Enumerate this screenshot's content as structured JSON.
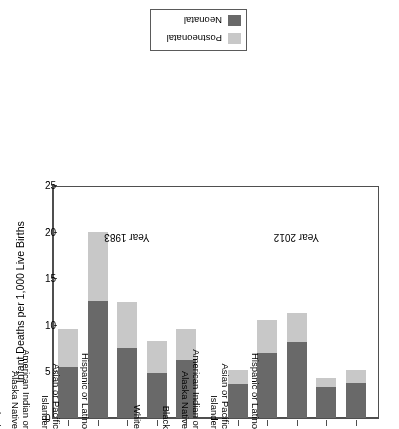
{
  "chart_data": {
    "type": "bar",
    "title": "",
    "subtitle": "",
    "orientation": "vertical-stacked",
    "rotated_180": true,
    "xlabel": "",
    "ylabel": "Infant Deaths per 1,000 Live Births",
    "ylim": [
      0,
      25
    ],
    "yticks": [
      0,
      5,
      10,
      15,
      20,
      25
    ],
    "ytick_labels": [
      "0",
      "5",
      "10",
      "15",
      "20",
      "25"
    ],
    "grid": false,
    "legend_position": "top-center",
    "legend": [
      {
        "name": "Postneonatal",
        "color": "#c8c8c8"
      },
      {
        "name": "Neonatal",
        "color": "#696969"
      }
    ],
    "series": [
      {
        "name": "Neonatal",
        "color": "#696969"
      },
      {
        "name": "Postneonatal",
        "color": "#c8c8c8"
      }
    ],
    "groups": [
      {
        "label": "Year 2012",
        "categories": [
          "Hispanic or Latino",
          "Asian or Pacific\nIslander",
          "American Indian or\nAlaska Native",
          "Black",
          "White"
        ],
        "values": {
          "Neonatal": [
            3.8,
            3.3,
            8.2,
            7.0,
            3.7
          ],
          "Postneonatal": [
            1.4,
            1.0,
            3.1,
            3.5,
            1.4
          ]
        },
        "totals": [
          5.2,
          4.3,
          11.3,
          10.5,
          5.1
        ]
      },
      {
        "label": "Year 1983",
        "categories": [
          "Hispanic or Latino",
          "Asian or Pacific\nIslander",
          "American Indian or\nAlaska Native",
          "Black",
          "White"
        ],
        "values": {
          "Neonatal": [
            6.2,
            4.8,
            7.5,
            12.5,
            5.5
          ],
          "Postneonatal": [
            3.3,
            3.5,
            5.0,
            7.5,
            4.0
          ]
        },
        "totals": [
          9.5,
          8.3,
          12.5,
          20.0,
          9.5
        ]
      }
    ]
  },
  "legend": {
    "items": [
      {
        "label": "Postneonatal",
        "color": "#c8c8c8"
      },
      {
        "label": "Neonatal",
        "color": "#696969"
      }
    ]
  },
  "axis": {
    "value_axis_title": "Infant Deaths per 1,000 Live Births",
    "value_ticks": [
      "0",
      "5",
      "10",
      "15",
      "20",
      "25"
    ]
  },
  "groups": [
    {
      "label": "Year 2012"
    },
    {
      "label": "Year 1983"
    }
  ]
}
